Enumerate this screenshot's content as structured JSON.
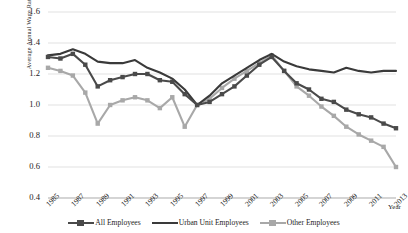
{
  "chart_data": {
    "type": "line",
    "title": "",
    "xlabel": "Year",
    "ylabel": "Average Annual Wage Ratio",
    "ylim": [
      0.4,
      1.6
    ],
    "ytick_values": [
      "1.6",
      "1.4",
      "1.2",
      "1.0",
      "0.8",
      "0.6",
      "0.4"
    ],
    "grid": true,
    "legend_position": "bottom",
    "x": [
      1985,
      1986,
      1987,
      1988,
      1989,
      1990,
      1991,
      1992,
      1993,
      1994,
      1995,
      1996,
      1997,
      1998,
      1999,
      2000,
      2001,
      2002,
      2003,
      2004,
      2005,
      2006,
      2007,
      2008,
      2009,
      2010,
      2011,
      2012,
      2013
    ],
    "xtick_labels": [
      "1985",
      "1987",
      "1989",
      "1991",
      "1993",
      "1995",
      "1997",
      "1999",
      "2001",
      "2003",
      "2005",
      "2007",
      "2009",
      "2011",
      "2013"
    ],
    "series": [
      {
        "name": "All Employees",
        "color": "#4a4a4a",
        "marker": "square",
        "values": [
          1.31,
          1.3,
          1.33,
          1.26,
          1.12,
          1.16,
          1.18,
          1.2,
          1.2,
          1.16,
          1.15,
          1.07,
          1.0,
          1.02,
          1.07,
          1.12,
          1.19,
          1.26,
          1.31,
          1.22,
          1.14,
          1.1,
          1.04,
          1.02,
          0.97,
          0.94,
          0.92,
          0.88,
          0.85
        ]
      },
      {
        "name": "Urban Unit Employees",
        "color": "#3a3a3a",
        "marker": "none",
        "values": [
          1.32,
          1.33,
          1.36,
          1.33,
          1.28,
          1.27,
          1.27,
          1.29,
          1.24,
          1.21,
          1.17,
          1.1,
          1.0,
          1.06,
          1.14,
          1.19,
          1.24,
          1.29,
          1.33,
          1.28,
          1.25,
          1.23,
          1.22,
          1.21,
          1.24,
          1.22,
          1.21,
          1.22,
          1.22
        ]
      },
      {
        "name": "Other Employees",
        "color": "#a8a8a8",
        "marker": "square",
        "values": [
          1.24,
          1.22,
          1.19,
          1.08,
          0.88,
          1.0,
          1.03,
          1.05,
          1.03,
          0.98,
          1.05,
          0.86,
          1.0,
          1.04,
          1.11,
          1.17,
          1.22,
          1.27,
          1.32,
          1.22,
          1.12,
          1.06,
          0.99,
          0.93,
          0.86,
          0.81,
          0.77,
          0.73,
          0.6
        ]
      }
    ]
  },
  "axis": {
    "y_title": "Average Annual Wage Ratio",
    "x_title": "Year"
  }
}
